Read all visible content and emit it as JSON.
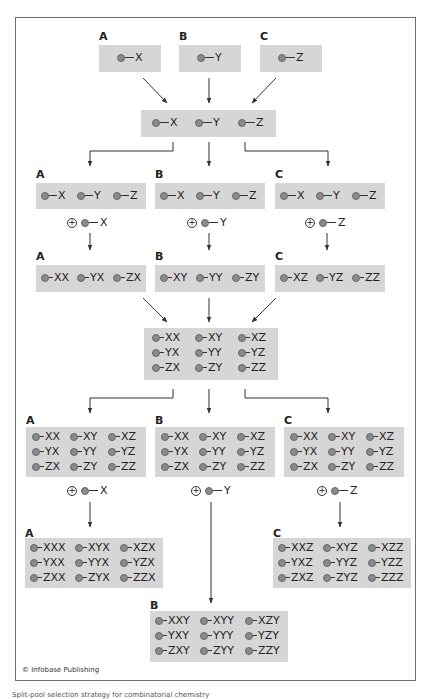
{
  "figure": {
    "copyright": "© Infobase Publishing",
    "caption": "Split-pool selection strategy for combinatorial chemistry",
    "colors": {
      "box_fill": "#d6d6d6",
      "dot": "#8a8a8a",
      "line": "#333333",
      "frame": "#6e6e6e"
    }
  },
  "stage1": {
    "groups": [
      {
        "label": "A",
        "items": [
          "X"
        ]
      },
      {
        "label": "B",
        "items": [
          "Y"
        ]
      },
      {
        "label": "C",
        "items": [
          "Z"
        ]
      }
    ]
  },
  "stage2_pool": {
    "items": [
      "X",
      "Y",
      "Z"
    ]
  },
  "stage3_split": {
    "groups": [
      {
        "label": "A",
        "items": [
          "X",
          "Y",
          "Z"
        ],
        "add": "X"
      },
      {
        "label": "B",
        "items": [
          "X",
          "Y",
          "Z"
        ],
        "add": "Y"
      },
      {
        "label": "C",
        "items": [
          "X",
          "Y",
          "Z"
        ],
        "add": "Z"
      }
    ]
  },
  "stage4_products": {
    "groups": [
      {
        "label": "A",
        "items": [
          "XX",
          "YX",
          "ZX"
        ]
      },
      {
        "label": "B",
        "items": [
          "XY",
          "YY",
          "ZY"
        ]
      },
      {
        "label": "C",
        "items": [
          "XZ",
          "YZ",
          "ZZ"
        ]
      }
    ]
  },
  "stage5_pool": {
    "items": [
      "XX",
      "XY",
      "XZ",
      "YX",
      "YY",
      "YZ",
      "ZX",
      "ZY",
      "ZZ"
    ]
  },
  "stage6_split": {
    "groups": [
      {
        "label": "A",
        "items": [
          "XX",
          "XY",
          "XZ",
          "YX",
          "YY",
          "YZ",
          "ZX",
          "ZY",
          "ZZ"
        ],
        "add": "X"
      },
      {
        "label": "B",
        "items": [
          "XX",
          "XY",
          "XZ",
          "YX",
          "YY",
          "YZ",
          "ZX",
          "ZY",
          "ZZ"
        ],
        "add": "Y"
      },
      {
        "label": "C",
        "items": [
          "XX",
          "XY",
          "XZ",
          "YX",
          "YY",
          "YZ",
          "ZX",
          "ZY",
          "ZZ"
        ],
        "add": "Z"
      }
    ]
  },
  "stage7_products": {
    "groups": [
      {
        "label": "A",
        "items": [
          "XXX",
          "XYX",
          "XZX",
          "YXX",
          "YYX",
          "YZX",
          "ZXX",
          "ZYX",
          "ZZX"
        ]
      },
      {
        "label": "B",
        "items": [
          "XXY",
          "XYY",
          "XZY",
          "YXY",
          "YYY",
          "YZY",
          "ZXY",
          "ZYY",
          "ZZY"
        ]
      },
      {
        "label": "C",
        "items": [
          "XXZ",
          "XYZ",
          "XZZ",
          "YXZ",
          "YYZ",
          "YZZ",
          "ZXZ",
          "ZYZ",
          "ZZZ"
        ]
      }
    ]
  }
}
